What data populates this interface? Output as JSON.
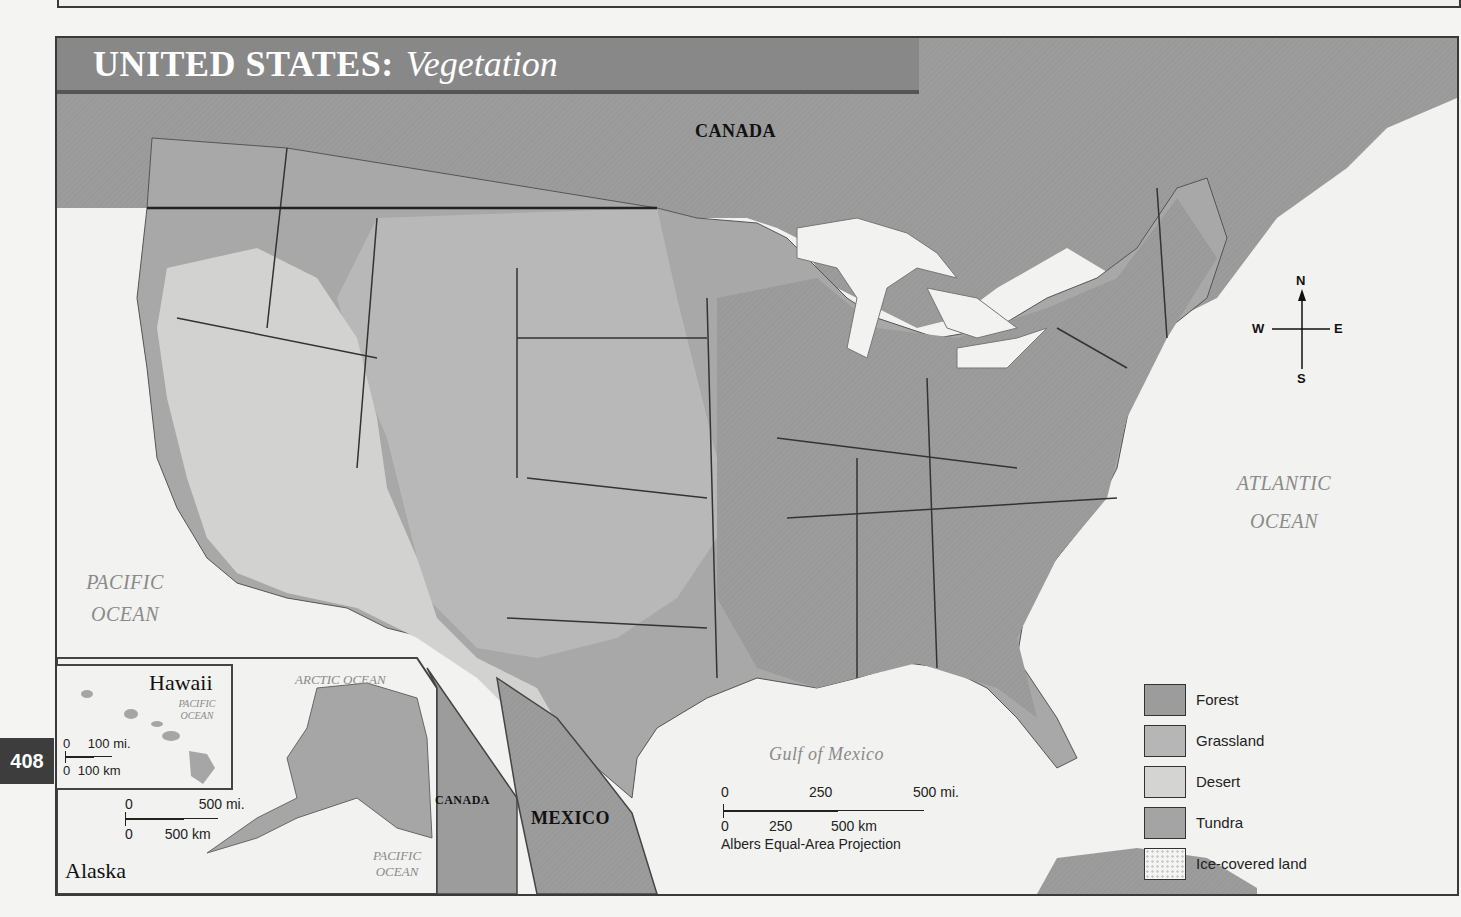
{
  "page": {
    "number": "408"
  },
  "title": {
    "main": "UNITED STATES:",
    "sub": "Vegetation"
  },
  "labels": {
    "canada_north": "CANADA",
    "canada_inset": "CANADA",
    "mexico": "MEXICO",
    "pacific_ocean_line1": "PACIFIC",
    "pacific_ocean_line2": "OCEAN",
    "atlantic_ocean_line1": "ATLANTIC",
    "atlantic_ocean_line2": "OCEAN",
    "gulf_of_mexico": "Gulf of Mexico",
    "arctic_ocean": "ARCTIC  OCEAN",
    "alaska_pacific_line1": "PACIFIC",
    "alaska_pacific_line2": "OCEAN",
    "hawaii_pacific_line1": "PACIFIC",
    "hawaii_pacific_line2": "OCEAN"
  },
  "insets": {
    "hawaii": {
      "title": "Hawaii",
      "scale_mi": [
        "0",
        "100 mi."
      ],
      "scale_km": [
        "0",
        "100 km"
      ]
    },
    "alaska": {
      "title": "Alaska",
      "scale_mi": [
        "0",
        "500 mi."
      ],
      "scale_km": [
        "0",
        "500 km"
      ]
    }
  },
  "compass": {
    "n": "N",
    "s": "S",
    "e": "E",
    "w": "W"
  },
  "scale_bar": {
    "mi": [
      "0",
      "250",
      "500 mi."
    ],
    "km": [
      "0",
      "250",
      "500 km"
    ],
    "projection": "Albers Equal-Area Projection"
  },
  "legend": {
    "items": [
      {
        "label": "Forest",
        "color": "#9c9c9c"
      },
      {
        "label": "Grassland",
        "color": "#b6b6b6"
      },
      {
        "label": "Desert",
        "color": "#d4d4d2"
      },
      {
        "label": "Tundra",
        "color": "#a4a4a4"
      },
      {
        "label": "Ice-covered land",
        "color": "#f4f4f2"
      }
    ]
  },
  "colors": {
    "forest": "#9c9c9c",
    "grassland": "#b6b6b6",
    "desert": "#d4d4d2",
    "water": "#f2f2f0",
    "border": "#333333",
    "title_bar": "#888888"
  }
}
